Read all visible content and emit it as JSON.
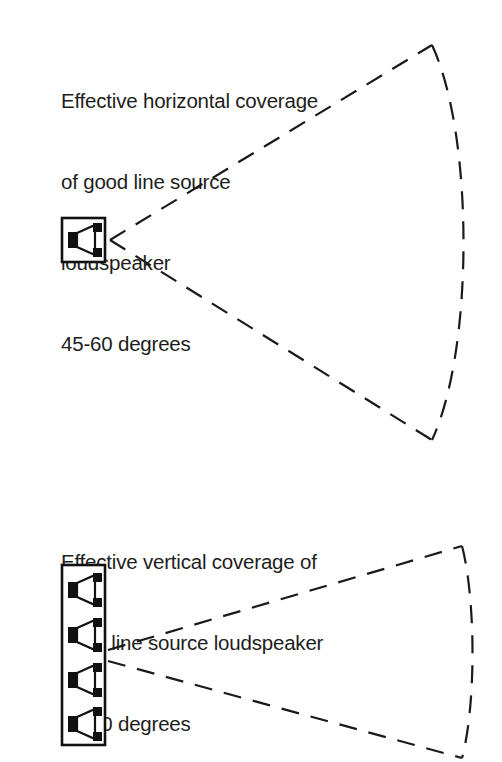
{
  "figure": {
    "background_color": "#ffffff",
    "ink_color": "#1a1a1a",
    "panels": [
      {
        "id": "horizontal",
        "caption_lines": [
          "Effective horizontal coverage",
          "of good line source",
          "loudspeaker",
          "45-60 degrees"
        ],
        "coverage_label": "45-60 degrees",
        "coverage_min_degrees": 45,
        "coverage_max_degrees": 60,
        "source_name": "good line source loudspeaker",
        "plane": "horizontal",
        "speaker": {
          "type": "single-driver-cabinet",
          "driver_count": 1,
          "cabinet_x": 62,
          "cabinet_y": 218,
          "cabinet_width": 43,
          "cabinet_height": 44
        },
        "fan": {
          "apex_x": 110,
          "apex_y": 240,
          "upper_end_x": 432,
          "upper_end_y": 45,
          "lower_end_x": 432,
          "lower_end_y": 440,
          "arc_bulge_x": 478,
          "style": "dashed"
        }
      },
      {
        "id": "vertical",
        "caption_lines": [
          "Effective vertical coverage of",
          "good line source loudspeaker",
          "25-30 degrees"
        ],
        "coverage_label": "25-30 degrees",
        "coverage_min_degrees": 25,
        "coverage_max_degrees": 30,
        "source_name": "good line source loudspeaker",
        "plane": "vertical",
        "speaker": {
          "type": "column-array-cabinet",
          "driver_count": 4,
          "cabinet_x": 62,
          "cabinet_y": 565,
          "cabinet_width": 43,
          "cabinet_height": 180
        },
        "fan": {
          "apex_x": 108,
          "apex_y": 655,
          "upper_end_x": 462,
          "upper_end_y": 546,
          "lower_end_x": 462,
          "lower_end_y": 758,
          "arc_bulge_x": 472,
          "style": "dashed"
        }
      }
    ],
    "line_style": {
      "dash_length": 18,
      "gap_length": 12,
      "stroke_width": 2
    }
  }
}
